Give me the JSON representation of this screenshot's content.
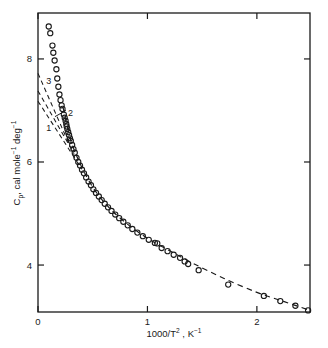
{
  "figure": {
    "background_color": "#ffffff",
    "ink_color": "#1a1a1a",
    "frame": {
      "left": 38,
      "right": 310,
      "top": 13,
      "bottom": 312
    }
  },
  "chart_data": {
    "type": "scatter",
    "title": "",
    "subtitle": "",
    "xlabel": "1000/T² , K⁻¹",
    "xlabel_parts": {
      "pre": "1000/T",
      "exp": "2",
      "mid": " , K",
      "exp2": "−1"
    },
    "ylabel": "Cₚ, cal mole⁻¹ deg⁻¹",
    "ylabel_parts": {
      "pre": "C",
      "sub": "p",
      "mid": ", cal mole",
      "exp1": "−1",
      "mid2": " deg",
      "exp2": "−1"
    },
    "xlim": [
      0,
      2.4854
    ],
    "ylim": [
      3.0887,
      8.8916
    ],
    "xticks": [
      0,
      1,
      2
    ],
    "xtick_labels": [
      "0",
      "1",
      "2"
    ],
    "yticks": [
      4,
      6,
      8
    ],
    "ytick_labels": [
      "4",
      "6",
      "8"
    ],
    "grid": false,
    "legend": "none",
    "minor_ticks": false,
    "tick_direction": "in",
    "marker": {
      "shape": "open-circle",
      "size_px": 5.2,
      "edge_color": "#1a1a1a",
      "face_color": "none",
      "line_width": 1.1
    },
    "series": [
      {
        "name": "Experimental heat capacity",
        "style": "open circles with dashed guide curve",
        "points": [
          [
            0.098,
            8.63
          ],
          [
            0.112,
            8.5
          ],
          [
            0.132,
            8.26
          ],
          [
            0.14,
            8.12
          ],
          [
            0.152,
            7.97
          ],
          [
            0.168,
            7.8
          ],
          [
            0.176,
            7.62
          ],
          [
            0.186,
            7.46
          ],
          [
            0.196,
            7.31
          ],
          [
            0.206,
            7.2
          ],
          [
            0.216,
            7.1
          ],
          [
            0.224,
            7.03
          ],
          [
            0.236,
            6.92
          ],
          [
            0.244,
            6.86
          ],
          [
            0.252,
            6.8
          ],
          [
            0.258,
            6.74
          ],
          [
            0.262,
            6.69
          ],
          [
            0.268,
            6.64
          ],
          [
            0.276,
            6.58
          ],
          [
            0.284,
            6.52
          ],
          [
            0.292,
            6.46
          ],
          [
            0.3,
            6.41
          ],
          [
            0.312,
            6.33
          ],
          [
            0.324,
            6.25
          ],
          [
            0.336,
            6.18
          ],
          [
            0.352,
            6.08
          ],
          [
            0.368,
            6.0
          ],
          [
            0.384,
            5.93
          ],
          [
            0.402,
            5.85
          ],
          [
            0.42,
            5.78
          ],
          [
            0.44,
            5.7
          ],
          [
            0.462,
            5.62
          ],
          [
            0.484,
            5.55
          ],
          [
            0.506,
            5.47
          ],
          [
            0.53,
            5.4
          ],
          [
            0.556,
            5.33
          ],
          [
            0.582,
            5.26
          ],
          [
            0.61,
            5.19
          ],
          [
            0.64,
            5.12
          ],
          [
            0.672,
            5.05
          ],
          [
            0.706,
            4.98
          ],
          [
            0.742,
            4.91
          ],
          [
            0.78,
            4.84
          ],
          [
            0.82,
            4.77
          ],
          [
            0.862,
            4.7
          ],
          [
            0.908,
            4.63
          ],
          [
            0.958,
            4.56
          ],
          [
            1.012,
            4.49
          ],
          [
            1.068,
            4.43
          ],
          [
            1.09,
            4.42
          ],
          [
            1.13,
            4.33
          ],
          [
            1.184,
            4.27
          ],
          [
            1.24,
            4.2
          ],
          [
            1.298,
            4.14
          ],
          [
            1.34,
            4.07
          ],
          [
            1.372,
            4.02
          ],
          [
            1.468,
            3.9
          ],
          [
            1.738,
            3.62
          ],
          [
            2.064,
            3.4
          ],
          [
            2.214,
            3.3
          ],
          [
            2.352,
            3.21
          ],
          [
            2.468,
            3.12
          ]
        ]
      }
    ],
    "fit_curve": {
      "name": "dashed guide through data",
      "style": "dashed",
      "points": [
        [
          0.23,
          7.05
        ],
        [
          0.3,
          6.42
        ],
        [
          0.4,
          5.9
        ],
        [
          0.52,
          5.45
        ],
        [
          0.66,
          5.09
        ],
        [
          0.82,
          4.79
        ],
        [
          1.0,
          4.52
        ],
        [
          1.2,
          4.28
        ],
        [
          1.42,
          4.03
        ],
        [
          1.7,
          3.74
        ],
        [
          2.0,
          3.47
        ],
        [
          2.25,
          3.29
        ],
        [
          2.47,
          3.13
        ]
      ]
    },
    "theory_lines": [
      {
        "label": "1",
        "label_x": 0.075,
        "label_y": 6.66,
        "style": "dashed",
        "start": [
          0.0,
          7.18
        ],
        "end": [
          0.4,
          5.86
        ]
      },
      {
        "label": "2",
        "label_x": 0.275,
        "label_y": 6.96,
        "style": "dashed",
        "start": [
          0.0,
          7.38
        ],
        "end": [
          0.33,
          6.16
        ]
      },
      {
        "label": "3",
        "label_x": 0.075,
        "label_y": 7.58,
        "style": "dashed",
        "start": [
          0.0,
          7.72
        ],
        "end": [
          0.29,
          6.32
        ]
      }
    ],
    "theory_label_leader": {
      "label": "2",
      "from": [
        0.155,
        6.88
      ],
      "to": [
        0.255,
        7.0
      ]
    }
  }
}
